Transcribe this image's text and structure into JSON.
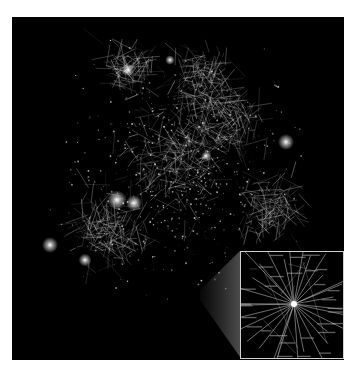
{
  "figure": {
    "background": "#000000",
    "node_color": "#ffffff",
    "edge_color": "#d8d8d8",
    "inset_border_color": "#cfcfcf"
  },
  "main_graph": {
    "bright_nodes": [
      {
        "x": 117,
        "y": 200,
        "r": 6
      },
      {
        "x": 134,
        "y": 203,
        "r": 5
      },
      {
        "x": 50,
        "y": 245,
        "r": 5
      },
      {
        "x": 85,
        "y": 260,
        "r": 4
      },
      {
        "x": 286,
        "y": 142,
        "r": 5
      },
      {
        "x": 128,
        "y": 70,
        "r": 4
      },
      {
        "x": 206,
        "y": 156,
        "r": 3
      },
      {
        "x": 170,
        "y": 60,
        "r": 3
      }
    ],
    "clusters": [
      {
        "x": 128,
        "y": 70,
        "spread": 30
      },
      {
        "x": 200,
        "y": 80,
        "spread": 40
      },
      {
        "x": 175,
        "y": 160,
        "spread": 70
      },
      {
        "x": 110,
        "y": 230,
        "spread": 50
      },
      {
        "x": 270,
        "y": 210,
        "spread": 40
      },
      {
        "x": 230,
        "y": 120,
        "spread": 45
      }
    ]
  },
  "inset": {
    "label": "zoomed detail of a hub node",
    "hub": {
      "x": 53,
      "y": 52
    },
    "edge_count": 30,
    "labels_legible": false
  },
  "caption": {
    "text": ""
  }
}
